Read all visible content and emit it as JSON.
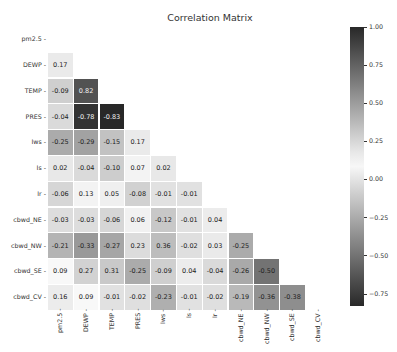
{
  "chart_data": {
    "type": "heatmap",
    "title": "Correlation Matrix",
    "xlabel": "",
    "ylabel": "",
    "variables": [
      "pm2.5",
      "DEWP",
      "TEMP",
      "PRES",
      "Iws",
      "Is",
      "Ir",
      "cbwd_NE",
      "cbwd_NW",
      "cbwd_SE",
      "cbwd_CV"
    ],
    "mask": "upper triangle including diagonal",
    "lower_triangle": [
      [],
      [
        0.17
      ],
      [
        -0.09,
        0.82
      ],
      [
        -0.04,
        -0.78,
        -0.83
      ],
      [
        -0.25,
        -0.29,
        -0.15,
        0.17
      ],
      [
        0.02,
        -0.04,
        -0.1,
        0.07,
        0.02
      ],
      [
        -0.06,
        0.13,
        0.05,
        -0.08,
        -0.01,
        -0.01
      ],
      [
        -0.03,
        -0.03,
        -0.06,
        0.06,
        -0.12,
        -0.01,
        0.04
      ],
      [
        -0.21,
        -0.33,
        -0.27,
        0.23,
        0.36,
        -0.02,
        0.03,
        -0.25
      ],
      [
        0.09,
        0.27,
        0.31,
        -0.25,
        -0.09,
        0.04,
        -0.04,
        -0.26,
        -0.5
      ],
      [
        0.16,
        0.09,
        -0.01,
        -0.02,
        -0.23,
        -0.01,
        -0.02,
        -0.19,
        -0.36,
        -0.38
      ]
    ],
    "colorbar": {
      "ticks": [
        "1.00",
        "0.75",
        "0.50",
        "0.25",
        "0.00",
        "−0.25",
        "−0.50",
        "−0.75"
      ],
      "tick_values": [
        1.0,
        0.75,
        0.5,
        0.25,
        0.0,
        -0.25,
        -0.5,
        -0.75
      ],
      "range": [
        -0.83,
        1.0
      ],
      "colormap": "diverging grayscale (dark at both extremes, white near 0.1)"
    }
  },
  "title": "Correlation Matrix"
}
